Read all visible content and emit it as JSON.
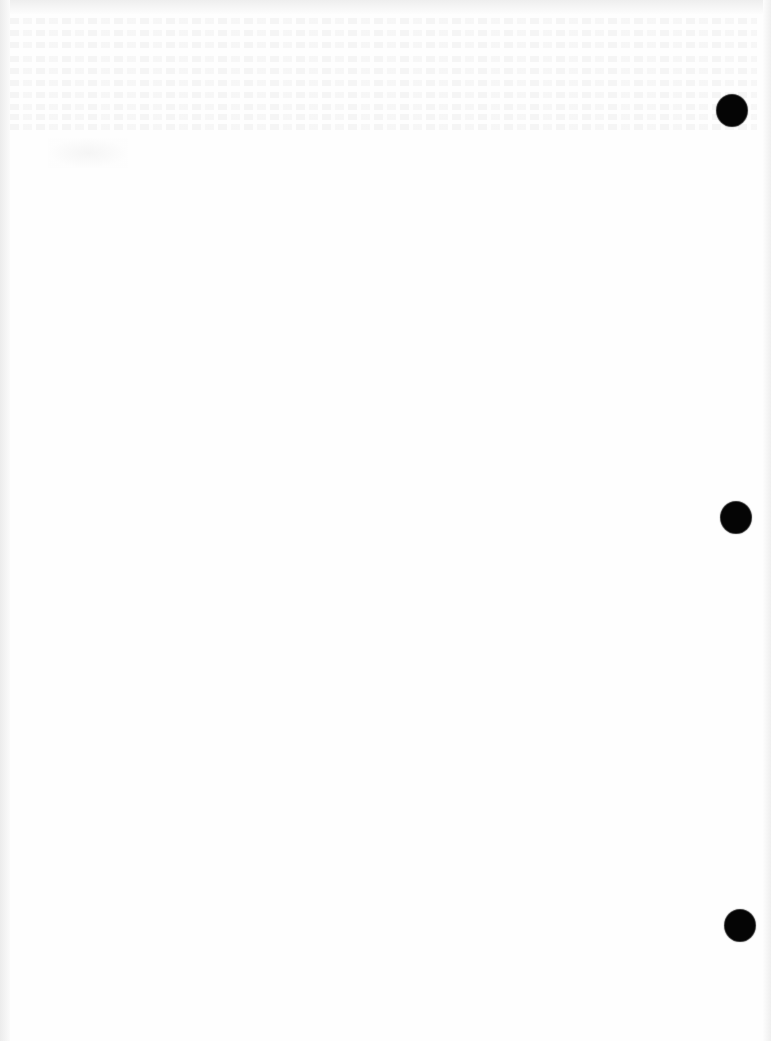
{
  "document": {
    "type": "scanned blank page",
    "text_visible": "",
    "background_color": "#fefefe",
    "punch_holes": [
      {
        "name": "punch-hole-top",
        "cx": 732,
        "cy": 110,
        "r": 15
      },
      {
        "name": "punch-hole-middle",
        "cx": 736,
        "cy": 517,
        "r": 15
      },
      {
        "name": "punch-hole-bottom",
        "cx": 740,
        "cy": 925,
        "r": 15
      }
    ],
    "hole_color": "#050505",
    "bleed_through_lines_y": [
      18,
      30,
      42,
      56,
      68,
      80,
      92,
      104,
      114,
      124
    ]
  }
}
